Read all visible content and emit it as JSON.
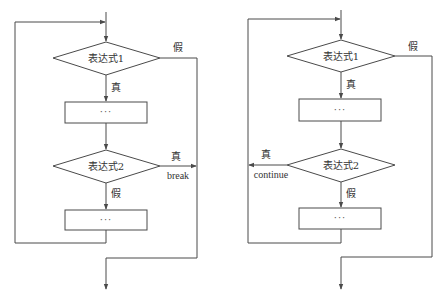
{
  "diagrams": [
    {
      "name": "break-loop-flowchart",
      "condition1": "表达式1",
      "condition1_false": "假",
      "condition1_true": "真",
      "block1": "···",
      "condition2": "表达式2",
      "condition2_true": "真",
      "condition2_true_action": "break",
      "condition2_false": "假",
      "block2": "···"
    },
    {
      "name": "continue-loop-flowchart",
      "condition1": "表达式1",
      "condition1_false": "假",
      "condition1_true": "真",
      "block1": "···",
      "condition2": "表达式2",
      "condition2_true": "真",
      "condition2_true_action": "continue",
      "condition2_false": "假",
      "block2": "···"
    }
  ],
  "colors": {
    "line": "#4a4a4a",
    "text": "#333333",
    "background": "#ffffff"
  }
}
